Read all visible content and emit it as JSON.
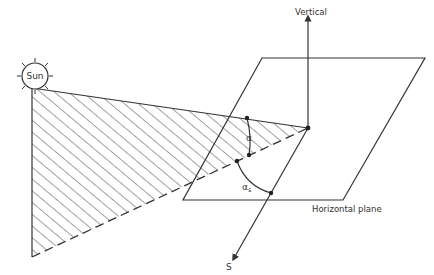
{
  "diagram": {
    "labels": {
      "sun": "Sun",
      "vertical": "Vertical",
      "horizontal_plane": "Horizontal plane",
      "south": "S",
      "altitude": "α",
      "azimuth": "α",
      "azimuth_sub": "s"
    },
    "colors": {
      "line": "#333333",
      "background": "#ffffff"
    }
  }
}
